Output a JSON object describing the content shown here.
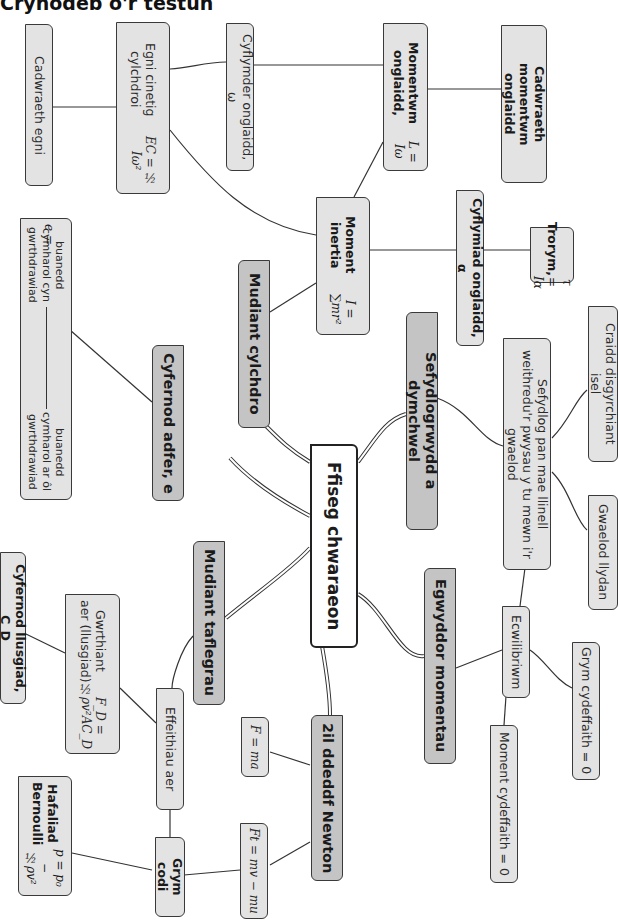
{
  "page": {
    "title": "Crynodeb o'r testun"
  },
  "root": {
    "label": "Ffiseg chwaraeon"
  },
  "branches": {
    "rotational": {
      "label": "Mudiant cylchdro",
      "moment_of_inertia": {
        "title": "Moment inertia",
        "formula": "I = ∑mr²"
      },
      "angular_momentum": {
        "title": "Momentwm onglaidd,",
        "formula": "L = Iω"
      },
      "conservation_angular_momentum": {
        "label": "Cadwraeth momentwm onglaidd"
      },
      "angular_velocity": {
        "label": "Cyflymder onglaidd, ω"
      },
      "rotational_ke": {
        "title": "Egni cinetig cylchdroi",
        "formula": "EC = ½ Iω²"
      },
      "conservation_energy": {
        "label": "Cadwraeth egni"
      },
      "angular_acceleration": {
        "label": "Cyflymiad onglaidd, α"
      },
      "torque": {
        "title": "Trorym,",
        "formula": "τ = Iα"
      }
    },
    "stability": {
      "label": "Sefydlogrwydd a dymchwel",
      "stable_when": {
        "label": "Sefydlog pan mae llinell weithredu'r pwysau y tu mewn i'r gwaelod"
      },
      "low_cog": {
        "label": "Craidd disgyrchiant isel"
      },
      "wide_base": {
        "label": "Gwaelod llydan"
      }
    },
    "moments": {
      "label": "Egwyddor momentau",
      "equilibrium": {
        "label": "Ecwilibriwm"
      },
      "resultant_force": {
        "label": "Grym cydeffaith = 0"
      },
      "resultant_moment": {
        "label": "Moment cydeffaith = 0"
      }
    },
    "restitution": {
      "label": "Cyfernod adfer, e",
      "formula": {
        "lhs": "e =",
        "numerator": "buanedd cymharol cyn gwrthdrawiad",
        "denominator": "buanedd cymharol ar ôl gwrthdrawiad"
      }
    },
    "projectile": {
      "label": "Mudiant taflegrau",
      "air_effects": {
        "label": "Effeithiau aer"
      },
      "air_resistance": {
        "title": "Gwrthiant aer (llusgiad)",
        "formula": "F_D = ½ρv²AC_D"
      },
      "drag_coefficient": {
        "label": "Cyfernod llusgiad, C_D"
      },
      "lift_force": {
        "label": "Grym codi"
      },
      "bernoulli": {
        "title": "Hafaliad Bernoulli",
        "formula": "p = p₀ − ½ρv²"
      }
    },
    "newton2": {
      "label": "2il ddeddf Newton",
      "f_ma": {
        "formula": "F = ma"
      },
      "impulse": {
        "formula": "Ft = mv − mu"
      }
    }
  },
  "colors": {
    "level2_fill": "#c4c4c4",
    "level3_fill": "#e3e3e3",
    "root_fill": "#ffffff",
    "border": "#3a3a3a"
  }
}
